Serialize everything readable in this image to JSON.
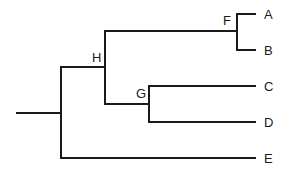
{
  "diagram": {
    "type": "phylogenetic-tree",
    "leaves": [
      {
        "id": "A",
        "label": "A",
        "x": 264,
        "y": 19
      },
      {
        "id": "B",
        "label": "B",
        "x": 264,
        "y": 55
      },
      {
        "id": "C",
        "label": "C",
        "x": 264,
        "y": 91
      },
      {
        "id": "D",
        "label": "D",
        "x": 264,
        "y": 127
      },
      {
        "id": "E",
        "label": "E",
        "x": 264,
        "y": 163
      }
    ],
    "internal_nodes": [
      {
        "id": "F",
        "label": "F",
        "children": [
          "A",
          "B"
        ],
        "x": 223,
        "y": 25
      },
      {
        "id": "G",
        "label": "G",
        "children": [
          "C",
          "D"
        ],
        "x": 136,
        "y": 98
      },
      {
        "id": "H",
        "label": "H",
        "children": [
          "F",
          "G"
        ],
        "x": 92,
        "y": 62
      }
    ],
    "root": {
      "children": [
        "H",
        "E"
      ]
    },
    "line_color": "#1a1a1a"
  }
}
